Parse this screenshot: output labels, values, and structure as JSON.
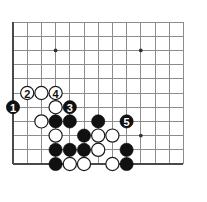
{
  "figure": {
    "board_background": "#ffffff",
    "line_color": "#8c8c8c",
    "edge_color": "#4a4a4a",
    "black_color": "#111111",
    "white_color": "#ffffff"
  },
  "board": {
    "origin_x": 13,
    "origin_y": 22,
    "spacing": 14.2,
    "cols": 13,
    "rows": 11,
    "stone_radius": 6.6,
    "star_radius": 1.9,
    "star_points": [
      {
        "col": 3,
        "row": 2
      },
      {
        "col": 9,
        "row": 2
      },
      {
        "col": 3,
        "row": 8
      },
      {
        "col": 9,
        "row": 8
      }
    ]
  },
  "stones": [
    {
      "id": "w-c1r5",
      "color": "white",
      "col": 1,
      "row": 5,
      "label": "2"
    },
    {
      "id": "w-c2r5",
      "color": "white",
      "col": 2,
      "row": 5,
      "label": ""
    },
    {
      "id": "w-c3r5",
      "color": "white",
      "col": 3,
      "row": 5,
      "label": "4"
    },
    {
      "id": "b-c0r6",
      "color": "black",
      "col": 0,
      "row": 6,
      "label": "1"
    },
    {
      "id": "w-c3r6",
      "color": "white",
      "col": 3,
      "row": 6,
      "label": ""
    },
    {
      "id": "b-c4r6",
      "color": "black",
      "col": 4,
      "row": 6,
      "label": "3"
    },
    {
      "id": "w-c2r7",
      "color": "white",
      "col": 2,
      "row": 7,
      "label": ""
    },
    {
      "id": "b-c3r7",
      "color": "black",
      "col": 3,
      "row": 7,
      "label": ""
    },
    {
      "id": "b-c4r7",
      "color": "black",
      "col": 4,
      "row": 7,
      "label": ""
    },
    {
      "id": "b-c6r7",
      "color": "black",
      "col": 6,
      "row": 7,
      "label": ""
    },
    {
      "id": "b-c8r7",
      "color": "black",
      "col": 8,
      "row": 7,
      "label": "5"
    },
    {
      "id": "w-c3r8",
      "color": "white",
      "col": 3,
      "row": 8,
      "label": ""
    },
    {
      "id": "b-c5r8",
      "color": "black",
      "col": 5,
      "row": 8,
      "label": ""
    },
    {
      "id": "w-c6r8",
      "color": "white",
      "col": 6,
      "row": 8,
      "label": ""
    },
    {
      "id": "w-c7r8",
      "color": "white",
      "col": 7,
      "row": 8,
      "label": ""
    },
    {
      "id": "b-c3r9",
      "color": "black",
      "col": 3,
      "row": 9,
      "label": ""
    },
    {
      "id": "b-c4r9",
      "color": "black",
      "col": 4,
      "row": 9,
      "label": ""
    },
    {
      "id": "b-c5r9",
      "color": "black",
      "col": 5,
      "row": 9,
      "label": ""
    },
    {
      "id": "w-c6r9",
      "color": "white",
      "col": 6,
      "row": 9,
      "label": ""
    },
    {
      "id": "b-c8r9",
      "color": "black",
      "col": 8,
      "row": 9,
      "label": ""
    },
    {
      "id": "b-c3r10",
      "color": "black",
      "col": 3,
      "row": 10,
      "label": ""
    },
    {
      "id": "w-c4r10",
      "color": "white",
      "col": 4,
      "row": 10,
      "label": ""
    },
    {
      "id": "w-c5r10",
      "color": "white",
      "col": 5,
      "row": 10,
      "label": ""
    },
    {
      "id": "w-c7r10",
      "color": "white",
      "col": 7,
      "row": 10,
      "label": ""
    },
    {
      "id": "b-c8r10",
      "color": "black",
      "col": 8,
      "row": 10,
      "label": ""
    }
  ],
  "move_sequence": [
    {
      "number": "1",
      "color": "black"
    },
    {
      "number": "2",
      "color": "white"
    },
    {
      "number": "3",
      "color": "black"
    },
    {
      "number": "4",
      "color": "white"
    },
    {
      "number": "5",
      "color": "black"
    }
  ]
}
